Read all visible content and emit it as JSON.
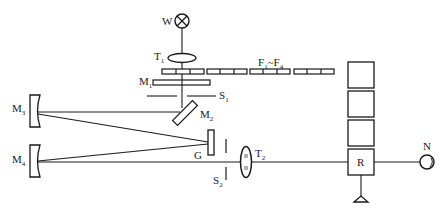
{
  "diagram": {
    "type": "optical-schematic",
    "colors": {
      "stroke": "#1a1a1a",
      "background": "#ffffff"
    },
    "labels": {
      "lamp": {
        "main": "W",
        "sub": ""
      },
      "lens1": {
        "main": "T",
        "sub": "1"
      },
      "filters": {
        "main": "F",
        "sub1": "1",
        "sep": "~F",
        "sub2": "4"
      },
      "mirror1": {
        "main": "M",
        "sub": "1"
      },
      "slit1": {
        "main": "S",
        "sub": "1"
      },
      "mirror2": {
        "main": "M",
        "sub": "2"
      },
      "mirror3": {
        "main": "M",
        "sub": "3"
      },
      "mirror4": {
        "main": "M",
        "sub": "4"
      },
      "grating": {
        "main": "G",
        "sub": ""
      },
      "lens2": {
        "main": "T",
        "sub": "2"
      },
      "slit2": {
        "main": "S",
        "sub": "2"
      },
      "receiver": {
        "main": "R",
        "sub": ""
      },
      "detector": {
        "main": "N",
        "sub": ""
      }
    },
    "components": [
      {
        "id": "W",
        "kind": "lamp-source",
        "icon": "circle-cross-icon"
      },
      {
        "id": "T1",
        "kind": "lens",
        "icon": "ellipse-lens-icon"
      },
      {
        "id": "F1~F4",
        "kind": "filter-strips",
        "count": 4
      },
      {
        "id": "M1",
        "kind": "flat-mirror"
      },
      {
        "id": "S1",
        "kind": "entrance-slit"
      },
      {
        "id": "M2",
        "kind": "diagonal-mirror"
      },
      {
        "id": "M3",
        "kind": "concave-mirror"
      },
      {
        "id": "M4",
        "kind": "concave-mirror"
      },
      {
        "id": "G",
        "kind": "grating"
      },
      {
        "id": "S2",
        "kind": "exit-slit"
      },
      {
        "id": "T2",
        "kind": "lens"
      },
      {
        "id": "R",
        "kind": "sample-holder",
        "stacked_boxes": 3
      },
      {
        "id": "N",
        "kind": "detector",
        "icon": "circle-detector-icon"
      }
    ]
  }
}
